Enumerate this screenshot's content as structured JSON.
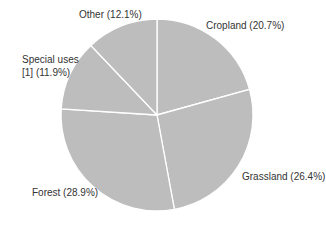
{
  "chart_data": {
    "type": "pie",
    "title": "",
    "categories": [
      "Cropland",
      "Grassland",
      "Forest",
      "Special uses [1]",
      "Other"
    ],
    "values": [
      20.7,
      26.4,
      28.9,
      11.9,
      12.1
    ],
    "unit": "%",
    "colors": [
      "#bdbdbd",
      "#bdbdbd",
      "#bdbdbd",
      "#bdbdbd",
      "#bdbdbd"
    ],
    "start_angle_deg": 0,
    "direction": "clockwise",
    "legend": "none",
    "labels": [
      "Cropland (20.7%)",
      "Grassland (26.4%)",
      "Forest (28.9%)",
      "Special uses [1] (11.9%)",
      "Other (12.1%)"
    ]
  },
  "labels": {
    "cropland": "Cropland (20.7%)",
    "grassland": "Grassland (26.4%)",
    "forest": "Forest (28.9%)",
    "special_line1": "Special uses",
    "special_line2": "[1]  (11.9%)",
    "other": "Other (12.1%)"
  }
}
